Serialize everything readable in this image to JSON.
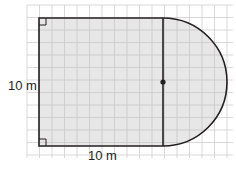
{
  "figure": {
    "type": "composite-shape-rectangle-semicircle",
    "grid": {
      "x0": 27,
      "y0": 5,
      "x1": 233,
      "y1": 158,
      "step": 12.5,
      "color": "#c8c8c8"
    },
    "rectangle": {
      "x": 39,
      "y": 18,
      "width": 124,
      "height": 128,
      "fill": "#e4e4e4",
      "stroke": "#231f20"
    },
    "semicircle": {
      "cx": 163,
      "cy": 82,
      "r": 64,
      "fill": "#e4e4e4",
      "stroke": "#231f20"
    },
    "center_dot": {
      "cx": 163,
      "cy": 82,
      "r": 2.6
    },
    "right_angle_markers": [
      {
        "corner": "top-left"
      },
      {
        "corner": "bottom-left"
      }
    ],
    "labels": {
      "side": "10 m",
      "bottom": "10 m"
    }
  }
}
